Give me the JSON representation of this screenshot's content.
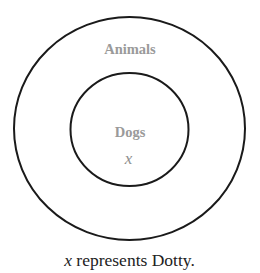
{
  "diagram": {
    "type": "nested-venn",
    "outer_set": {
      "label": "Animals"
    },
    "inner_set": {
      "label": "Dogs"
    },
    "element": {
      "symbol": "x",
      "belongs_to": [
        "Dogs",
        "Animals"
      ]
    },
    "caption": {
      "variable": "x",
      "text": " represents Dotty."
    },
    "colors": {
      "outline": "#1a1a1a",
      "set_label": "#9a9a9a",
      "element_label": "#8e8e8e",
      "caption": "#222222"
    }
  }
}
